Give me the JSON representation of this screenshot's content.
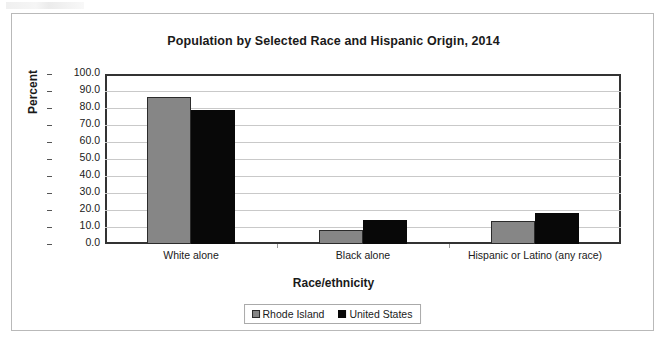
{
  "figure": {
    "title": "Population by Selected Race and Hispanic Origin, 2014"
  },
  "legend": {
    "position": "bottom-center",
    "entries": [
      {
        "label": "Rhode Island",
        "color": "#868686",
        "swatch": "gray-square-icon"
      },
      {
        "label": "United States",
        "color": "#080808",
        "swatch": "black-square-icon"
      }
    ]
  },
  "axes": {
    "y_title": "Percent",
    "x_title": "Race/ethnicity",
    "y_ticks": [
      "100.0",
      "90.0",
      "80.0",
      "70.0",
      "60.0",
      "50.0",
      "40.0",
      "30.0",
      "20.0",
      "10.0",
      "0.0"
    ]
  },
  "chart_data": {
    "type": "bar",
    "title": "Population by Selected Race and Hispanic Origin, 2014",
    "xlabel": "Race/ethnicity",
    "ylabel": "Percent",
    "ylim": [
      0,
      100
    ],
    "ytick_step": 10,
    "grid": true,
    "legend_position": "bottom-center",
    "categories": [
      "White alone",
      "Black alone",
      "Hispanic or Latino (any race)"
    ],
    "series": [
      {
        "name": "Rhode Island",
        "color": "#868686",
        "values": [
          86.5,
          8.0,
          13.6
        ]
      },
      {
        "name": "United States",
        "color": "#080808",
        "values": [
          79.0,
          14.2,
          18.1
        ]
      }
    ]
  }
}
